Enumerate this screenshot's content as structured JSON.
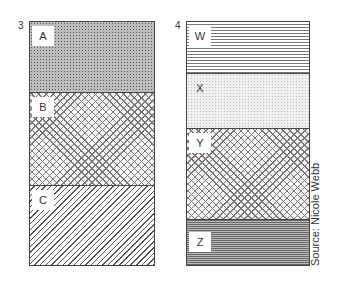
{
  "figure": {
    "columns": [
      {
        "number": "3",
        "layers": [
          {
            "label": "A",
            "pattern": "dense-dots"
          },
          {
            "label": "B",
            "pattern": "crosshatch"
          },
          {
            "label": "C",
            "pattern": "diagonal-lines"
          }
        ]
      },
      {
        "number": "4",
        "layers": [
          {
            "label": "W",
            "pattern": "horizontal-lines"
          },
          {
            "label": "X",
            "pattern": "light-stipple"
          },
          {
            "label": "Y",
            "pattern": "crosshatch"
          },
          {
            "label": "Z",
            "pattern": "dense-horizontal-lines"
          }
        ]
      }
    ],
    "source": "Source: Nicole Webb"
  }
}
